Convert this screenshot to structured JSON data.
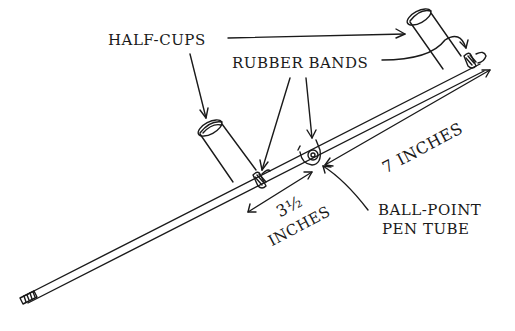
{
  "diagram": {
    "type": "hand-drawn labeled illustration",
    "colors": {
      "ink": "#1a1a1a",
      "background": "#ffffff"
    },
    "labels": {
      "half_cups": "HALF-CUPS",
      "rubber_bands": "RUBBER BANDS",
      "seven_inches": "7 INCHES",
      "three_half_num": "3½",
      "three_half_unit": "INCHES",
      "ball_point_line1": "BALL-POINT",
      "ball_point_line2": "PEN TUBE"
    },
    "measurements": [
      {
        "label": "3½ INCHES",
        "from": "rubber band (left cup)",
        "to": "ball-point pen tube"
      },
      {
        "label": "7 INCHES",
        "from": "ball-point pen tube",
        "to": "end of stick (right cup)"
      }
    ],
    "parts": [
      "stick",
      "half-cup (left)",
      "half-cup (right)",
      "rubber band (left)",
      "rubber band (right)",
      "ball-point pen tube pivot"
    ]
  }
}
